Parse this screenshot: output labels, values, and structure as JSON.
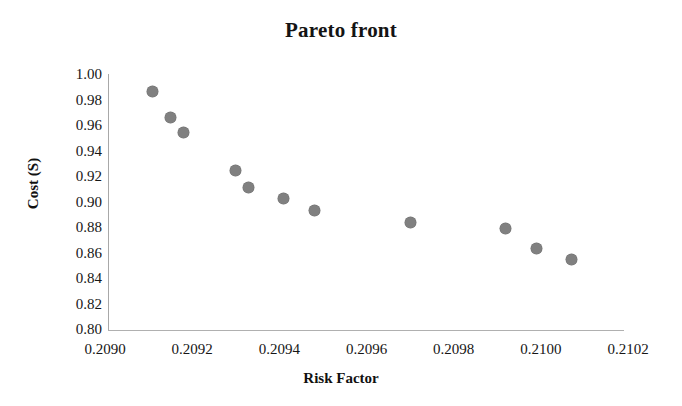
{
  "chart_data": {
    "type": "scatter",
    "title": "Pareto front",
    "xlabel": "Risk Factor",
    "ylabel": "Cost (S)",
    "xlim": [
      0.209,
      0.2102
    ],
    "ylim": [
      0.8,
      1.0
    ],
    "xticks": [
      "0.2090",
      "0.2092",
      "0.2094",
      "0.2096",
      "0.2098",
      "0.2100",
      "0.2102"
    ],
    "xtick_values": [
      0.209,
      0.2092,
      0.2094,
      0.2096,
      0.2098,
      0.21,
      0.2102
    ],
    "yticks": [
      "0.80",
      "0.82",
      "0.84",
      "0.86",
      "0.88",
      "0.90",
      "0.92",
      "0.94",
      "0.96",
      "0.98",
      "1.00"
    ],
    "ytick_values": [
      0.8,
      0.82,
      0.84,
      0.86,
      0.88,
      0.9,
      0.92,
      0.94,
      0.96,
      0.98,
      1.0
    ],
    "grid": false,
    "legend": false,
    "marker_color": "#808080",
    "marker_shape": "circle",
    "series": [
      {
        "name": "Pareto front",
        "x": [
          0.20911,
          0.20915,
          0.20918,
          0.2093,
          0.20933,
          0.20941,
          0.20948,
          0.2097,
          0.20992,
          0.20999,
          0.21007
        ],
        "y": [
          0.987,
          0.967,
          0.955,
          0.925,
          0.912,
          0.903,
          0.894,
          0.884,
          0.88,
          0.864,
          0.855
        ]
      }
    ]
  }
}
